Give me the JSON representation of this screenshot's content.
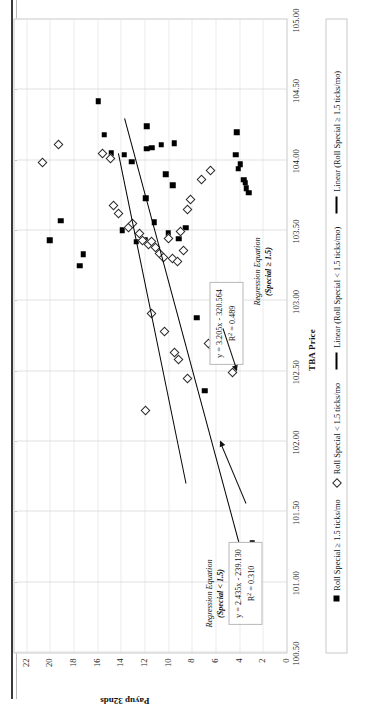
{
  "chart_data": {
    "type": "scatter",
    "title": "",
    "xlabel": "TBA Price",
    "ylabel": "Payup 32nds",
    "xlim": [
      100.5,
      105.0
    ],
    "ylim": [
      0,
      23
    ],
    "xticks": [
      "100.50",
      "101.00",
      "101.50",
      "102.00",
      "102.50",
      "103.00",
      "103.50",
      "104.00",
      "104.50",
      "105.00"
    ],
    "yticks": [
      "0",
      "2",
      "4",
      "6",
      "8",
      "10",
      "12",
      "14",
      "16",
      "18",
      "20",
      "22"
    ],
    "grid": "both-dotted",
    "legend_position": "bottom",
    "legend": [
      {
        "label": "Roll Special ≥ 1.5 ticks/mo",
        "marker": "filled-square"
      },
      {
        "label": "Roll Special < 1.5 ticks/mo",
        "marker": "open-diamond"
      },
      {
        "label": "Linear (Roll Special < 1.5 ticks/mo)",
        "marker": "line"
      },
      {
        "label": "Linear (Roll Special ≥ 1.5 ticks/mo)",
        "marker": "line"
      }
    ],
    "series": [
      {
        "name": "Roll Special ≥ 1.5 ticks/mo",
        "marker": "filled-square",
        "points": [
          [
            103.43,
            20.0
          ],
          [
            103.57,
            19.1
          ],
          [
            103.25,
            17.5
          ],
          [
            103.33,
            17.2
          ],
          [
            104.42,
            15.9
          ],
          [
            104.18,
            15.4
          ],
          [
            104.05,
            14.8
          ],
          [
            103.5,
            13.9
          ],
          [
            104.04,
            13.7
          ],
          [
            103.99,
            13.1
          ],
          [
            103.42,
            12.7
          ],
          [
            103.43,
            12.0
          ],
          [
            103.73,
            11.9
          ],
          [
            104.08,
            11.8
          ],
          [
            104.24,
            11.8
          ],
          [
            104.09,
            11.4
          ],
          [
            103.56,
            11.2
          ],
          [
            104.11,
            10.6
          ],
          [
            103.9,
            10.2
          ],
          [
            103.48,
            10.0
          ],
          [
            103.82,
            9.6
          ],
          [
            104.12,
            9.5
          ],
          [
            103.44,
            9.1
          ],
          [
            103.52,
            8.5
          ],
          [
            102.88,
            7.6
          ],
          [
            102.36,
            6.9
          ],
          [
            104.04,
            4.3
          ],
          [
            104.2,
            4.2
          ],
          [
            103.94,
            4.1
          ],
          [
            103.97,
            3.9
          ],
          [
            103.86,
            3.6
          ],
          [
            103.84,
            3.5
          ],
          [
            103.8,
            3.4
          ],
          [
            103.77,
            3.2
          ],
          [
            101.28,
            2.9
          ]
        ]
      },
      {
        "name": "Roll Special < 1.5 ticks/mo",
        "marker": "open-diamond",
        "points": [
          [
            103.98,
            20.6
          ],
          [
            104.11,
            19.3
          ],
          [
            104.05,
            15.6
          ],
          [
            104.01,
            14.9
          ],
          [
            103.68,
            14.6
          ],
          [
            103.62,
            14.2
          ],
          [
            103.52,
            13.4
          ],
          [
            103.55,
            13.0
          ],
          [
            103.48,
            12.4
          ],
          [
            103.43,
            12.2
          ],
          [
            103.4,
            11.7
          ],
          [
            103.42,
            11.4
          ],
          [
            103.38,
            11.1
          ],
          [
            103.34,
            10.7
          ],
          [
            103.31,
            10.4
          ],
          [
            103.44,
            10.0
          ],
          [
            103.3,
            9.6
          ],
          [
            103.28,
            9.2
          ],
          [
            103.49,
            9.0
          ],
          [
            103.36,
            8.7
          ],
          [
            103.65,
            8.4
          ],
          [
            103.72,
            8.1
          ],
          [
            103.86,
            7.2
          ],
          [
            102.91,
            11.4
          ],
          [
            102.78,
            10.3
          ],
          [
            102.63,
            9.5
          ],
          [
            102.58,
            9.1
          ],
          [
            102.45,
            8.4
          ],
          [
            102.7,
            6.6
          ],
          [
            102.66,
            6.2
          ],
          [
            102.61,
            5.9
          ],
          [
            103.02,
            5.3
          ],
          [
            102.22,
            11.9
          ],
          [
            103.93,
            6.4
          ],
          [
            102.49,
            4.6
          ]
        ]
      }
    ],
    "trendlines": [
      {
        "name": "Linear (Roll Special < 1.5 ticks/mo)",
        "equation": "y = 2.435x - 239.130",
        "r2_label": "R",
        "r2_sup": "2",
        "r2_value": " = 0.310",
        "slope": 2.435,
        "intercept": -239.13,
        "r2": 0.31,
        "x_from": 101.7,
        "x_to": 104.05
      },
      {
        "name": "Linear (Roll Special ≥ 1.5 ticks/mo)",
        "equation": "y = 3.205x - 320.564",
        "r2_label": "R",
        "r2_sup": "2",
        "r2_value": " = 0.489",
        "slope": 3.205,
        "intercept": -320.564,
        "r2": 0.489,
        "x_from": 101.15,
        "x_to": 104.3
      }
    ],
    "annotations": [
      {
        "title_line1": "Regression Equation",
        "title_line2": "(Special < 1.5)",
        "equation": "y = 2.435x - 239.130",
        "r2_prefix": "R",
        "r2_sup": "2",
        "r2_rest": " = 0.310"
      },
      {
        "title_line1": "Regression Equation",
        "title_line2": "(Special ≥ 1.5)",
        "equation": "y = 3.205x - 320.564",
        "r2_prefix": "R",
        "r2_sup": "2",
        "r2_rest": " = 0.489"
      }
    ],
    "colors": {
      "marker": "#000000",
      "line": "#000000",
      "grid": "#c4c4c4",
      "frame": "#c9c9c9"
    }
  }
}
